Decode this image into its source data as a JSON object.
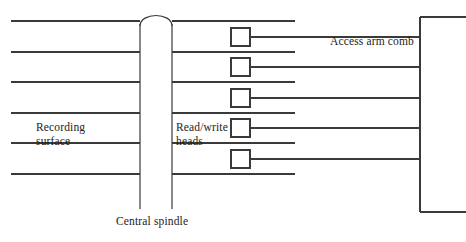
{
  "diagram": {
    "type": "schematic",
    "stroke_color": "#3a3a3a",
    "background_color": "#ffffff",
    "width": 466,
    "height": 242
  },
  "labels": {
    "recording_surface": "Recording\nsurface",
    "read_write_heads": "Read/write\nheads",
    "access_arm_comb": "Access arm comb",
    "central_spindle": "Central spindle"
  },
  "geometry": {
    "platter_line_ys": [
      21,
      52,
      82,
      113,
      143,
      174
    ],
    "platter_left_x_start": 11,
    "platter_left_x_end": 140,
    "platter_right_x_start": 172,
    "platter_right_x_end": 295,
    "spindle": {
      "left_x": 140,
      "right_x": 172,
      "top_y": 24,
      "bottom_y": 209,
      "dome_peak_y": 11
    },
    "head_boxes": [
      {
        "x": 231,
        "y": 28,
        "w": 19,
        "h": 18
      },
      {
        "x": 231,
        "y": 58,
        "w": 19,
        "h": 18
      },
      {
        "x": 231,
        "y": 89,
        "w": 19,
        "h": 18
      },
      {
        "x": 231,
        "y": 119,
        "w": 19,
        "h": 18
      },
      {
        "x": 231,
        "y": 150,
        "w": 19,
        "h": 18
      }
    ],
    "arm_line_ys": [
      37,
      67,
      98,
      128,
      159
    ],
    "arm_x_start": 250,
    "arm_x_end": 420,
    "comb_bracket": {
      "vertical_x": 420,
      "top_y": 17,
      "bottom_y": 212,
      "stub_x_end": 466
    }
  }
}
